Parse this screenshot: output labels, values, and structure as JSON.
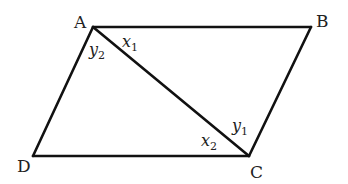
{
  "diagram": {
    "stroke_color": "#111111",
    "vertices": {
      "A": {
        "label": "A",
        "x": 93,
        "y": 27
      },
      "B": {
        "label": "B",
        "x": 311,
        "y": 27
      },
      "C": {
        "label": "C",
        "x": 249,
        "y": 156
      },
      "D": {
        "label": "D",
        "x": 33,
        "y": 156
      }
    },
    "edges": [
      "AB",
      "BC",
      "CD",
      "DA",
      "AC"
    ],
    "angles": {
      "x1": {
        "base": "x",
        "sub": "1",
        "at": "A",
        "between": "AB, AC"
      },
      "y2": {
        "base": "y",
        "sub": "2",
        "at": "A",
        "between": "AD, AC"
      },
      "y1": {
        "base": "y",
        "sub": "1",
        "at": "C",
        "between": "CB, CA"
      },
      "x2": {
        "base": "x",
        "sub": "2",
        "at": "C",
        "between": "CD, CA"
      }
    }
  }
}
